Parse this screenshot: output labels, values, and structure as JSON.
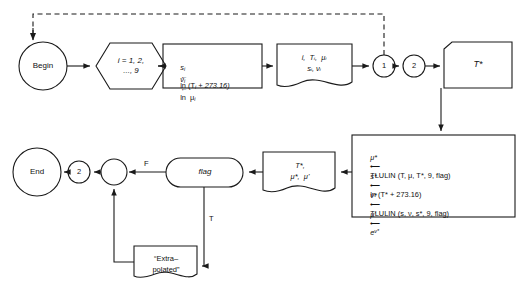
{
  "diagram": {
    "stroke_color": "#1a1a1a",
    "background_color": "#ffffff",
    "nodes": {
      "begin": {
        "label": "Begin",
        "shape": "terminator-circle"
      },
      "loop": {
        "label_line1": "i = 1, 2,",
        "label_line2": "..., 9",
        "shape": "hexagon-preparation"
      },
      "compute": {
        "line1_lhs": "s",
        "line1_sub": "i",
        "line1_rhs": "ln (T",
        "line1_rhs_sub": "i",
        "line1_tail": " + 273.16)",
        "line2_lhs": "ν",
        "line2_sub": "i",
        "line2_rhs": "ln  μ",
        "line2_rhs_sub": "i",
        "shape": "process-rectangle"
      },
      "print_table": {
        "line1": "i,  Tᵢ,  μᵢ",
        "line2": "sᵢ, νᵢ",
        "shape": "document"
      },
      "connector_1": {
        "label": "1",
        "shape": "connector-circle"
      },
      "connector_2_top": {
        "label": "2",
        "shape": "connector-circle"
      },
      "input_tstar": {
        "label": "T*",
        "shape": "manual-input"
      },
      "tlulin_box": {
        "shape": "process-rectangle",
        "lines": [
          "μ* ← TLULIN (T, μ, T*, 9, flag)",
          "s* ← ln (T* + 273.16)",
          "ν* ← TLULIN (s, ν, s*, 9, flag)",
          "μ' ← e⁽ν*⁾"
        ],
        "line1_plain": "TLULIN (T, μ, T*, 9, flag)",
        "line2_plain": "ln (T* + 273.16)",
        "line3_plain": "TLULIN (s, ν, s*, 9, flag)",
        "line4_plain": "e"
      },
      "print_results": {
        "line1": "T*,",
        "line2": "μ*,  μ'",
        "shape": "document"
      },
      "flag_decision": {
        "label": "flag",
        "shape": "rounded-decision"
      },
      "extrapolated_note": {
        "line1": "“Extra–",
        "line2": "polated”",
        "shape": "document"
      },
      "merge_circle": {
        "label": "",
        "shape": "merge-circle"
      },
      "connector_2_bottom": {
        "label": "2",
        "shape": "connector-circle"
      },
      "end": {
        "label": "End",
        "shape": "terminator-circle"
      }
    },
    "edge_labels": {
      "false_branch": "F",
      "true_branch": "T"
    }
  }
}
